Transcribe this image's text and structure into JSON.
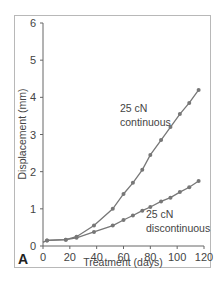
{
  "chart_data": {
    "type": "line",
    "title": "",
    "panel_label": "A",
    "xlabel": "Treatment (days)",
    "ylabel": "Displacement (mm)",
    "xlim": [
      0,
      120
    ],
    "ylim": [
      0,
      6
    ],
    "xticks": [
      0,
      20,
      40,
      60,
      80,
      100,
      120
    ],
    "yticks": [
      0,
      1,
      2,
      3,
      4,
      5,
      6
    ],
    "grid": false,
    "legend": "inline annotations",
    "series": [
      {
        "name": "25 cN continuous",
        "annotation": [
          "25 cN",
          "continuous"
        ],
        "color": "#777777",
        "x": [
          0,
          3,
          17,
          25,
          38,
          52,
          60,
          67,
          74,
          80,
          88,
          95,
          102,
          109,
          116
        ],
        "y": [
          0.1,
          0.15,
          0.17,
          0.25,
          0.55,
          1.0,
          1.4,
          1.7,
          2.05,
          2.45,
          2.85,
          3.2,
          3.55,
          3.85,
          4.2
        ]
      },
      {
        "name": "25 cN discontinuous",
        "annotation": [
          "25 cN",
          "discontinuous"
        ],
        "color": "#777777",
        "x": [
          0,
          3,
          17,
          25,
          38,
          52,
          60,
          67,
          74,
          80,
          88,
          95,
          102,
          109,
          116
        ],
        "y": [
          0.1,
          0.15,
          0.17,
          0.22,
          0.38,
          0.55,
          0.7,
          0.82,
          0.95,
          1.05,
          1.2,
          1.3,
          1.45,
          1.58,
          1.75
        ]
      }
    ]
  }
}
